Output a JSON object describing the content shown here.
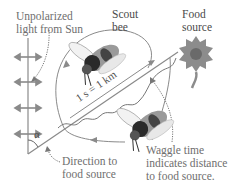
{
  "labels": {
    "light_line1": "Unpolarized",
    "light_line2": "light from Sun",
    "bee_line1": "Scout",
    "bee_line2": "bee",
    "food_line1": "Food",
    "food_line2": "source",
    "scale": "1 s = 1 km",
    "angle": "α",
    "direction_line1": "Direction to",
    "direction_line2": "food source",
    "waggle_line1": "Waggle time",
    "waggle_line2": "indicates distance",
    "waggle_line3": "to food source."
  },
  "icons": {
    "polarization_arrows": "double-headed-arrow-icon",
    "scout_bee": "bee-icon",
    "food_source": "flower-icon"
  },
  "colors": {
    "text": "#6e6e6e",
    "line": "#8a8a8a",
    "flower": "#8c8c8c",
    "bee_body": "#9a9a9a",
    "bee_dark": "#2a2a2a"
  }
}
